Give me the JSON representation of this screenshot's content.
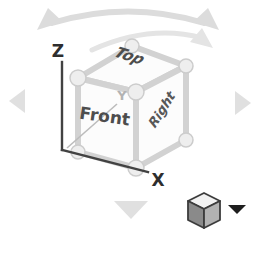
{
  "viewcube": {
    "faces": {
      "top": "Top",
      "front": "Front",
      "right": "Right"
    },
    "axes": {
      "x": "X",
      "y": "Y",
      "z": "Z"
    },
    "icons": {
      "orbit_arc": "orbit-rotate-arc-icon",
      "inner_arc": "roll-rotate-arc-icon",
      "left": "rotate-left-triangle-icon",
      "right": "rotate-right-triangle-icon",
      "down": "rotate-down-triangle-icon",
      "menu_cube": "cube-icon",
      "dropdown": "dropdown-arrow-icon"
    },
    "colors": {
      "background": "#ffffff",
      "cube_face": "#fcfcfc",
      "cube_edge": "#d2d2d2",
      "face_label": "#4d4d4d",
      "axis_dark": "#424242",
      "axis_light": "#bcbcbc",
      "nav_arrow": "#e0e0e0",
      "orbit_arrow": "#dcdcdc",
      "icon_left_face": "#8a8a8a",
      "icon_right_face": "#b2b2b2",
      "dropdown": "#1e1e1e"
    }
  }
}
